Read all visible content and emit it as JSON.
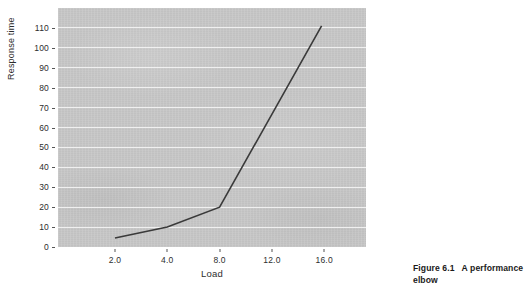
{
  "figure": {
    "caption_number": "Figure 6.1",
    "caption_text": "A performance elbow"
  },
  "chart_data": {
    "type": "line",
    "title": "",
    "xlabel": "Load",
    "ylabel": "Response time",
    "x": [
      2.0,
      4.0,
      8.0,
      15.8
    ],
    "values": [
      4.5,
      10,
      20,
      111
    ],
    "series": [
      {
        "name": "Response time",
        "x": [
          2.0,
          4.0,
          8.0,
          15.8
        ],
        "values": [
          4.5,
          10,
          20,
          111
        ]
      }
    ],
    "xticks": [
      "2.0",
      "4.0",
      "8.0",
      "12.0",
      "16.0"
    ],
    "xtick_values": [
      2.0,
      4.0,
      8.0,
      12.0,
      16.0
    ],
    "yticks": [
      "0",
      "10",
      "20",
      "30",
      "40",
      "50",
      "60",
      "70",
      "80",
      "90",
      "100",
      "110"
    ],
    "ytick_values": [
      0,
      10,
      20,
      30,
      40,
      50,
      60,
      70,
      80,
      90,
      100,
      110
    ],
    "ylim": [
      0,
      120
    ],
    "xlim": [
      0.6,
      17.3
    ],
    "grid": "horizontal-white",
    "legend": "none",
    "plot_background": "#c8c8c8",
    "gridline_color": "#f2f2f2",
    "line_color": "#3a3a3a",
    "annotations": []
  }
}
